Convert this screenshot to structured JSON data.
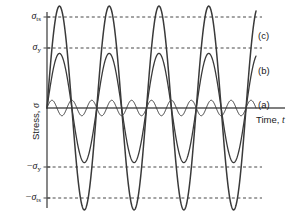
{
  "chart_data": {
    "type": "line",
    "title": "",
    "xlabel": "Time, t",
    "ylabel": "Stress, σ",
    "xlim": [
      0,
      1
    ],
    "ylim": [
      -1.3,
      1.3
    ],
    "grid": true,
    "legend_position": "right-inline",
    "reference_lines": [
      {
        "label": "σ_ts",
        "display": "σ",
        "sub": "ts",
        "sign": "",
        "value": 1.0,
        "y_px": 17,
        "style": "dashed"
      },
      {
        "label": "σ_y",
        "display": "σ",
        "sub": "y",
        "sign": "",
        "value": 0.65,
        "y_px": 48,
        "style": "dashed"
      },
      {
        "label": "-σ_y",
        "display": "σ",
        "sub": "y",
        "sign": "−",
        "value": -0.65,
        "y_px": 167,
        "style": "dashed"
      },
      {
        "label": "-σ_ts",
        "display": "σ",
        "sub": "ts",
        "sign": "−",
        "value": -1.0,
        "y_px": 198,
        "style": "dashed"
      }
    ],
    "zero_axis_y_px": 108,
    "axis_origin_x_px": 47,
    "curve_end_x_px": 256,
    "series": [
      {
        "name": "(a)",
        "amplitude": 0.085,
        "cycles": 10.5,
        "label_x_px": 258,
        "label_y_px": 100,
        "linewidth": 1.0,
        "color": "#3a3a3a"
      },
      {
        "name": "(b)",
        "amplitude": 0.6,
        "cycles": 4.2,
        "label_x_px": 258,
        "label_y_px": 66,
        "linewidth": 1.3,
        "color": "#3a3a3a"
      },
      {
        "name": "(c)",
        "amplitude": 1.12,
        "cycles": 4.2,
        "label_x_px": 258,
        "label_y_px": 31,
        "linewidth": 1.5,
        "color": "#3a3a3a"
      }
    ]
  },
  "axis": {
    "x_label": "Time,",
    "x_symbol": "t",
    "y_label": "Stress,",
    "y_symbol": "σ"
  },
  "colors": {
    "axis": "#555555",
    "grid": "#333333",
    "curve": "#3a3a3a",
    "background": "#ffffff"
  }
}
